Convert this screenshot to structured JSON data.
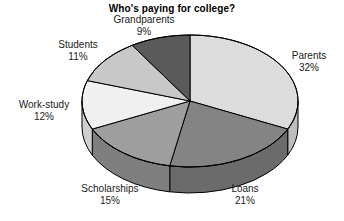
{
  "chart_data": {
    "type": "pie",
    "title": "Who's paying for college?",
    "xlabel": "",
    "ylabel": "",
    "grid": false,
    "legend": "none",
    "label_format": "name above percent",
    "three_d": true,
    "start_angle_deg": 0,
    "direction": "clockwise",
    "categories": [
      "Parents",
      "Loans",
      "Scholarships",
      "Work-study",
      "Students",
      "Grandparents"
    ],
    "values": [
      32,
      21,
      15,
      12,
      11,
      9
    ],
    "unit": "%",
    "total": 100,
    "slices": [
      {
        "label": "Parents",
        "value": 32,
        "value_text": "32%",
        "color": "#dcdcdc",
        "side_color": "#bdbdbd"
      },
      {
        "label": "Loans",
        "value": 21,
        "value_text": "21%",
        "color": "#848484",
        "side_color": "#6b6b6b"
      },
      {
        "label": "Scholarships",
        "value": 15,
        "value_text": "15%",
        "color": "#9e9e9e",
        "side_color": "#7f7f7f"
      },
      {
        "label": "Work-study",
        "value": 12,
        "value_text": "12%",
        "color": "#f0f0f0",
        "side_color": "#cfcfcf"
      },
      {
        "label": "Students",
        "value": 11,
        "value_text": "11%",
        "color": "#c8c8c8",
        "side_color": "#a9a9a9"
      },
      {
        "label": "Grandparents",
        "value": 9,
        "value_text": "9%",
        "color": "#5a5a5a",
        "side_color": "#484848"
      }
    ]
  },
  "chart": {
    "title": "Who's paying for college?",
    "labels": {
      "grandparents": {
        "name": "Grandparents",
        "value": "9%"
      },
      "students": {
        "name": "Students",
        "value": "11%"
      },
      "workstudy": {
        "name": "Work-study",
        "value": "12%"
      },
      "scholarships": {
        "name": "Scholarships",
        "value": "15%"
      },
      "loans": {
        "name": "Loans",
        "value": "21%"
      },
      "parents": {
        "name": "Parents",
        "value": "32%"
      }
    }
  },
  "colors": {
    "background": "#ffffff",
    "text": "#1a1a1a",
    "outline": "#000000"
  }
}
